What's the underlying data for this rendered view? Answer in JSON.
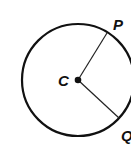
{
  "diagram": {
    "type": "circle-with-radii",
    "circle": {
      "center": [
        78,
        80
      ],
      "radius": 56,
      "stroke": "#111111"
    },
    "center_point": {
      "label": "C",
      "x": 78,
      "y": 80
    },
    "points": [
      {
        "label": "P",
        "x": 107,
        "y": 33
      },
      {
        "label": "Q",
        "x": 119,
        "y": 118
      }
    ],
    "segments": [
      {
        "from": "C",
        "to": "P"
      },
      {
        "from": "C",
        "to": "Q"
      }
    ]
  }
}
